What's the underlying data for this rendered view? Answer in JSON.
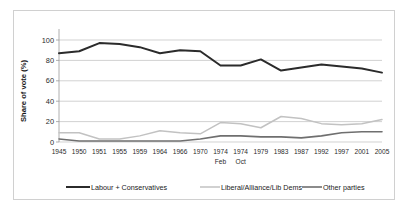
{
  "chart_data": {
    "type": "line",
    "title": "",
    "xlabel": "",
    "ylabel": "Share of vote (%)",
    "ylim": [
      0,
      100
    ],
    "yticks": [
      0,
      20,
      40,
      60,
      80,
      100
    ],
    "grid": true,
    "legend_position": "bottom",
    "categories": [
      "1945",
      "1950",
      "1951",
      "1955",
      "1959",
      "1964",
      "1966",
      "1970",
      "1974",
      "1974",
      "1979",
      "1983",
      "1987",
      "1992",
      "1997",
      "2001",
      "2005"
    ],
    "category_sublabels": [
      "",
      "",
      "",
      "",
      "",
      "",
      "",
      "",
      "Feb",
      "Oct",
      "",
      "",
      "",
      "",
      "",
      "",
      ""
    ],
    "series": [
      {
        "name": "Labour + Conservatives",
        "color": "#2b2b2b",
        "width": 2.0,
        "values": [
          87,
          89,
          97,
          96,
          93,
          87,
          90,
          89,
          75,
          75,
          81,
          70,
          73,
          76,
          74,
          72,
          68
        ]
      },
      {
        "name": "Liberal/Alliance/Lib Dems",
        "color": "#c2c2c2",
        "width": 1.5,
        "values": [
          9,
          9,
          3,
          3,
          6,
          11,
          9,
          8,
          19,
          18,
          14,
          25,
          23,
          18,
          17,
          18,
          22
        ]
      },
      {
        "name": "Other parties",
        "color": "#6f6f6f",
        "width": 1.6,
        "values": [
          3,
          1,
          1,
          1,
          1,
          1,
          1,
          3,
          6,
          6,
          5,
          5,
          4,
          6,
          9,
          10,
          10
        ]
      }
    ]
  }
}
